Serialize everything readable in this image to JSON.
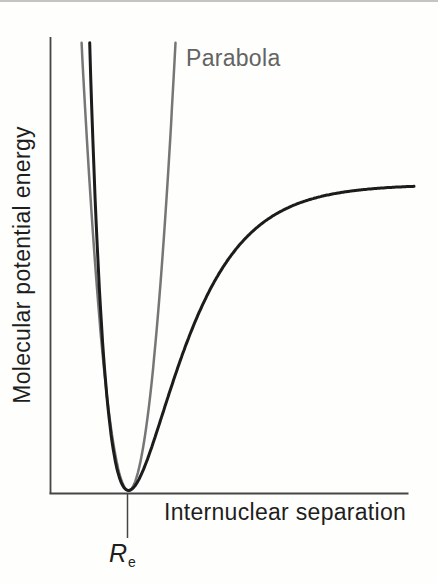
{
  "figure": {
    "ylabel": "Molecular potential energy",
    "xlabel": "Internuclear separation",
    "parabola_label": "Parabola",
    "re_label": {
      "main": "R",
      "sub": "e"
    }
  },
  "colors": {
    "curve_black": "#1c1c1c",
    "curve_gray": "#767676",
    "axis": "#454545",
    "tick": "#454545",
    "label_black": "#1e1e1e",
    "label_gray": "#636363",
    "top_rule": "#c4c4c4",
    "background": "#fefefd"
  },
  "chart_data": {
    "type": "line",
    "xlabel": "Internuclear separation",
    "ylabel": "Molecular potential energy",
    "xlim": [
      0,
      1.02
    ],
    "ylim": [
      0,
      1.0
    ],
    "grid": false,
    "axes_numeric": false,
    "legend_position": "inline-annotation",
    "x_axis_annotations": [
      {
        "label": "Re",
        "x": 0.218,
        "tick_below_axis": true
      }
    ],
    "annotations": [
      {
        "text": "Parabola",
        "attached_to": "parabola",
        "x": 0.38,
        "v": 0.95
      }
    ],
    "series": [
      {
        "name": "Parabola (harmonic approximation)",
        "model": "parabola",
        "color_key": "curve_gray",
        "stroke_width": 2.5,
        "params": {
          "re": 0.218,
          "k": 57.0,
          "v_top": 0.982,
          "min_offset": 0.0066
        },
        "sample_points_x_v": [
          [
            0.087,
            0.982
          ],
          [
            0.1,
            0.794
          ],
          [
            0.13,
            0.441
          ],
          [
            0.16,
            0.192
          ],
          [
            0.19,
            0.045
          ],
          [
            0.218,
            0.0
          ],
          [
            0.25,
            0.058
          ],
          [
            0.28,
            0.219
          ],
          [
            0.31,
            0.482
          ],
          [
            0.349,
            0.982
          ]
        ]
      },
      {
        "name": "Molecular potential energy (Morse-type curve)",
        "model": "morse",
        "color_key": "curve_black",
        "stroke_width": 3,
        "params": {
          "re": 0.218,
          "depth": 0.671,
          "a": 7.3,
          "x_end": 1.017,
          "v_top": 0.982,
          "min_offset": 0.0066
        },
        "sample_points_x_v": [
          [
            0.109,
            0.982
          ],
          [
            0.13,
            0.543
          ],
          [
            0.15,
            0.277
          ],
          [
            0.18,
            0.068
          ],
          [
            0.218,
            0.0
          ],
          [
            0.26,
            0.047
          ],
          [
            0.32,
            0.185
          ],
          [
            0.4,
            0.363
          ],
          [
            0.5,
            0.51
          ],
          [
            0.65,
            0.615
          ],
          [
            0.8,
            0.652
          ],
          [
            1.017,
            0.667
          ]
        ]
      }
    ]
  }
}
